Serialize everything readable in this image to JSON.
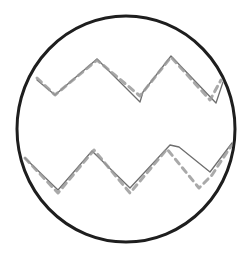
{
  "figure": {
    "background": "#ffffff",
    "circle": {
      "cx": 126,
      "cy": 129,
      "rx": 109,
      "ry": 113,
      "stroke": "#1e1e1e",
      "stroke_width": 3
    },
    "waves": [
      {
        "name": "top-wave",
        "solid": {
          "stroke": "#6e6e6e",
          "points": "37,80 55,95 97,59 140,102 143,92 171,56 216,103 223,82"
        },
        "dashed": {
          "stroke": "#9a9a9a",
          "points": "37,78 55,95 97,60 140,96 171,57 210,100 221,80"
        }
      },
      {
        "name": "bottom-wave",
        "solid": {
          "stroke": "#6e6e6e",
          "points": "25,158 58,190 92,151 130,188 170,145 179,147 210,172 232,143"
        },
        "dashed": {
          "stroke": "#9a9a9a",
          "points": "25,158 58,193 94,150 130,193 167,149 199,188 212,175 231,146"
        }
      }
    ]
  }
}
